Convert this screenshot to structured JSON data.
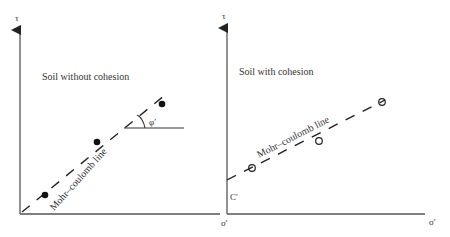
{
  "left_panel": {
    "title": "Soil without cohesion",
    "y_axis_label": "τ",
    "x_axis_label": "σ′",
    "line_label": "Mohr–coulomb line",
    "angle_label": "φ′",
    "points": [
      [
        38,
        195
      ],
      [
        97,
        144
      ],
      [
        162,
        104
      ]
    ],
    "point_style": "filled"
  },
  "right_panel": {
    "title": "Soil with cohesion",
    "y_axis_label": "τ",
    "x_axis_label": "σ′",
    "origin_label": "σ′",
    "intercept_label": "C′",
    "line_label": "Mohr–coulomb line",
    "points": [
      [
        252,
        168
      ],
      [
        318,
        141
      ],
      [
        380,
        102
      ]
    ],
    "point_style": "open"
  }
}
